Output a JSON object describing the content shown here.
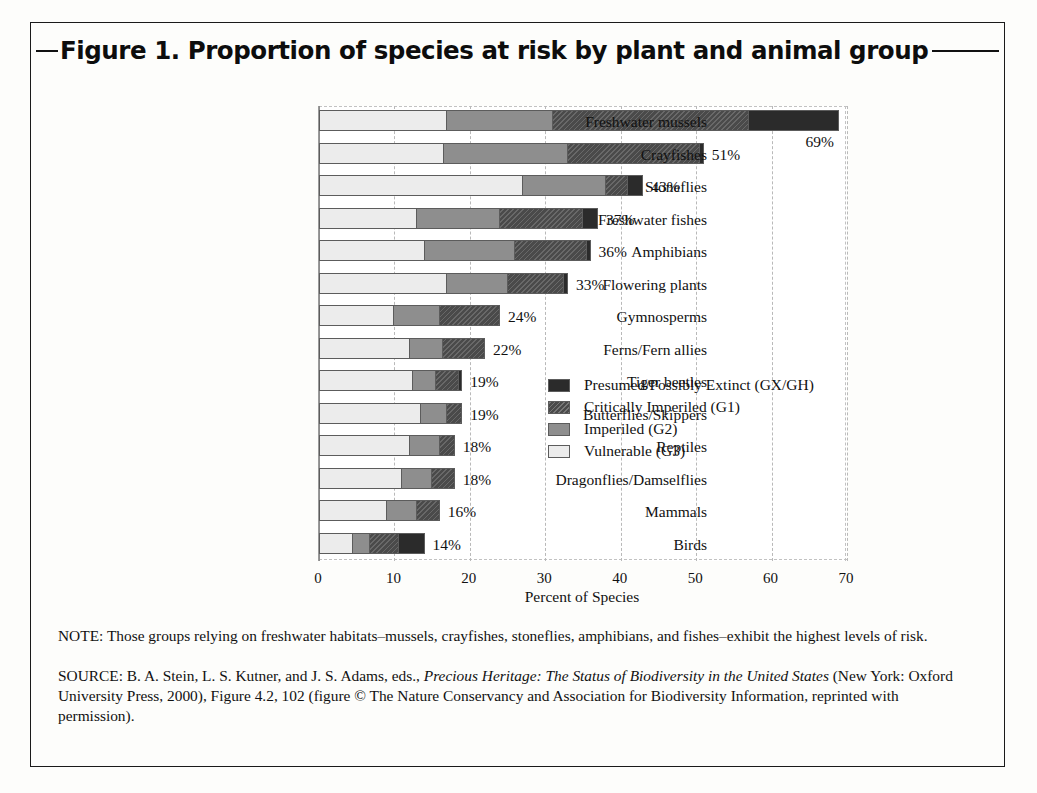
{
  "figure": {
    "title": "Figure 1. Proportion of species at risk by plant and animal group",
    "note": "NOTE: Those groups relying on freshwater habitats–mussels, crayfishes, stoneflies, amphibians, and fishes–exhibit the highest levels of risk.",
    "source_prefix": "SOURCE: B. A. Stein, L. S. Kutner, and J. S. Adams, eds., ",
    "source_italic": "Precious Heritage: The Status of Biodiversity in the United States",
    "source_suffix": " (New York: Oxford University Press, 2000), Figure 4.2, 102 (figure © The Nature Conservancy and Association for Biodiversity Information, reprinted with permission)."
  },
  "colors": {
    "extinct": "#2b2b2b",
    "critically_imperiled": "#4a4a4a",
    "imperiled": "#8e8e8e",
    "vulnerable": "#ececec",
    "gridline": "#b9b9b9",
    "text": "#111111"
  },
  "chart_data": {
    "type": "bar",
    "orientation": "horizontal",
    "stacked": true,
    "title": "Figure 1. Proportion of species at risk by plant and animal group",
    "xlabel": "Percent of Species",
    "ylabel": "",
    "xlim": [
      0,
      70
    ],
    "xticks": [
      0,
      10,
      20,
      30,
      40,
      50,
      60,
      70
    ],
    "xtick_labels": [
      "0",
      "10",
      "20",
      "30",
      "40",
      "50",
      "60",
      "70"
    ],
    "grid": true,
    "legend_position": "center-right-inside",
    "categories": [
      "Freshwater mussels",
      "Crayfishes",
      "Stoneflies",
      "Freshwater fishes",
      "Amphibians",
      "Flowering plants",
      "Gymnosperms",
      "Ferns/Fern allies",
      "Tiger beetles",
      "Butterflies/Skippers",
      "Reptiles",
      "Dragonflies/Damselflies",
      "Mammals",
      "Birds"
    ],
    "series": [
      {
        "name": "Vulnerable (G3)",
        "key": "g3",
        "color": "#ececec",
        "values": [
          17,
          16.6,
          27,
          13,
          14,
          17,
          10,
          12,
          12.5,
          13.5,
          12,
          11,
          9,
          4.5
        ]
      },
      {
        "name": "Imperiled (G2)",
        "key": "g2",
        "color": "#8e8e8e",
        "values": [
          14,
          16.4,
          11,
          11,
          12,
          8,
          6,
          4.5,
          3,
          3.5,
          4,
          4,
          4,
          2.3
        ]
      },
      {
        "name": "Critically Imperiled (G1)",
        "key": "g1",
        "color": "#4a4a4a",
        "values": [
          26,
          17.5,
          3,
          11,
          9.5,
          7.5,
          8,
          5.5,
          3,
          2,
          2,
          3,
          3,
          3.8
        ]
      },
      {
        "name": "Presumed/Possibly Extinct (GX/GH)",
        "key": "gx",
        "color": "#2b2b2b",
        "values": [
          12,
          0.5,
          2,
          2,
          0.5,
          0.5,
          0,
          0,
          0.5,
          0,
          0,
          0,
          0,
          3.4
        ]
      }
    ],
    "totals": [
      69,
      51,
      43,
      37,
      36,
      33,
      24,
      22,
      19,
      19,
      18,
      18,
      16,
      14
    ],
    "total_labels": [
      "69%",
      "51%",
      "43%",
      "37%",
      "36%",
      "33%",
      "24%",
      "22%",
      "19%",
      "19%",
      "18%",
      "18%",
      "16%",
      "14%"
    ]
  },
  "legend": {
    "items": [
      {
        "label": "Presumed/Possibly Extinct (GX/GH)",
        "key": "gx"
      },
      {
        "label": "Critically Imperiled (G1)",
        "key": "g1"
      },
      {
        "label": "Imperiled (G2)",
        "key": "g2"
      },
      {
        "label": "Vulnerable (G3)",
        "key": "g3"
      }
    ]
  }
}
